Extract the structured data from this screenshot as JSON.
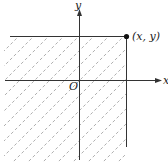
{
  "diagram": {
    "type": "coordinate-plane-region",
    "axes": {
      "x_label": "x",
      "y_label": "y",
      "origin_label": "O"
    },
    "point": {
      "label": "(x, y)"
    },
    "region": {
      "description": "shaded quadrant region to the left of and below the point (x, y)",
      "fill": "diagonal dashed hatching"
    },
    "colors": {
      "line": "#333333",
      "hatch": "#9a9a9a",
      "background": "#ffffff"
    }
  }
}
